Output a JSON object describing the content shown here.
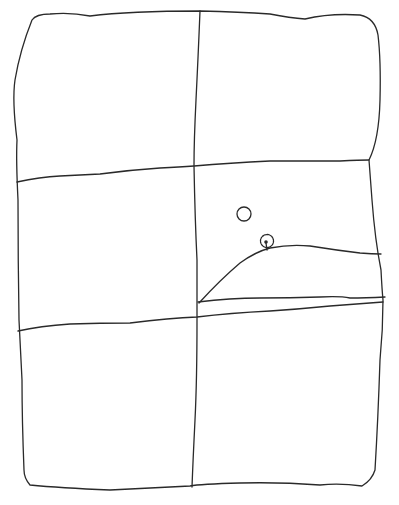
{
  "sketch": {
    "description": "Hand-drawn sketch of a rectangle divided into a 2x3 grid of panels",
    "panels": [
      {
        "id": "top-left",
        "content": "empty"
      },
      {
        "id": "top-right",
        "content": "empty"
      },
      {
        "id": "middle-left",
        "content": "empty"
      },
      {
        "id": "middle-right",
        "content": "landscape with hill, small tree, and sun/moon circle"
      },
      {
        "id": "bottom-left",
        "content": "empty"
      },
      {
        "id": "bottom-right",
        "content": "empty"
      }
    ],
    "elements": {
      "circle": "sun-or-moon",
      "tree": "small-tree",
      "hill": "hill-line",
      "ground": "ground-lines"
    },
    "stroke_color": "#2a2a2a",
    "background_color": "#ffffff"
  }
}
